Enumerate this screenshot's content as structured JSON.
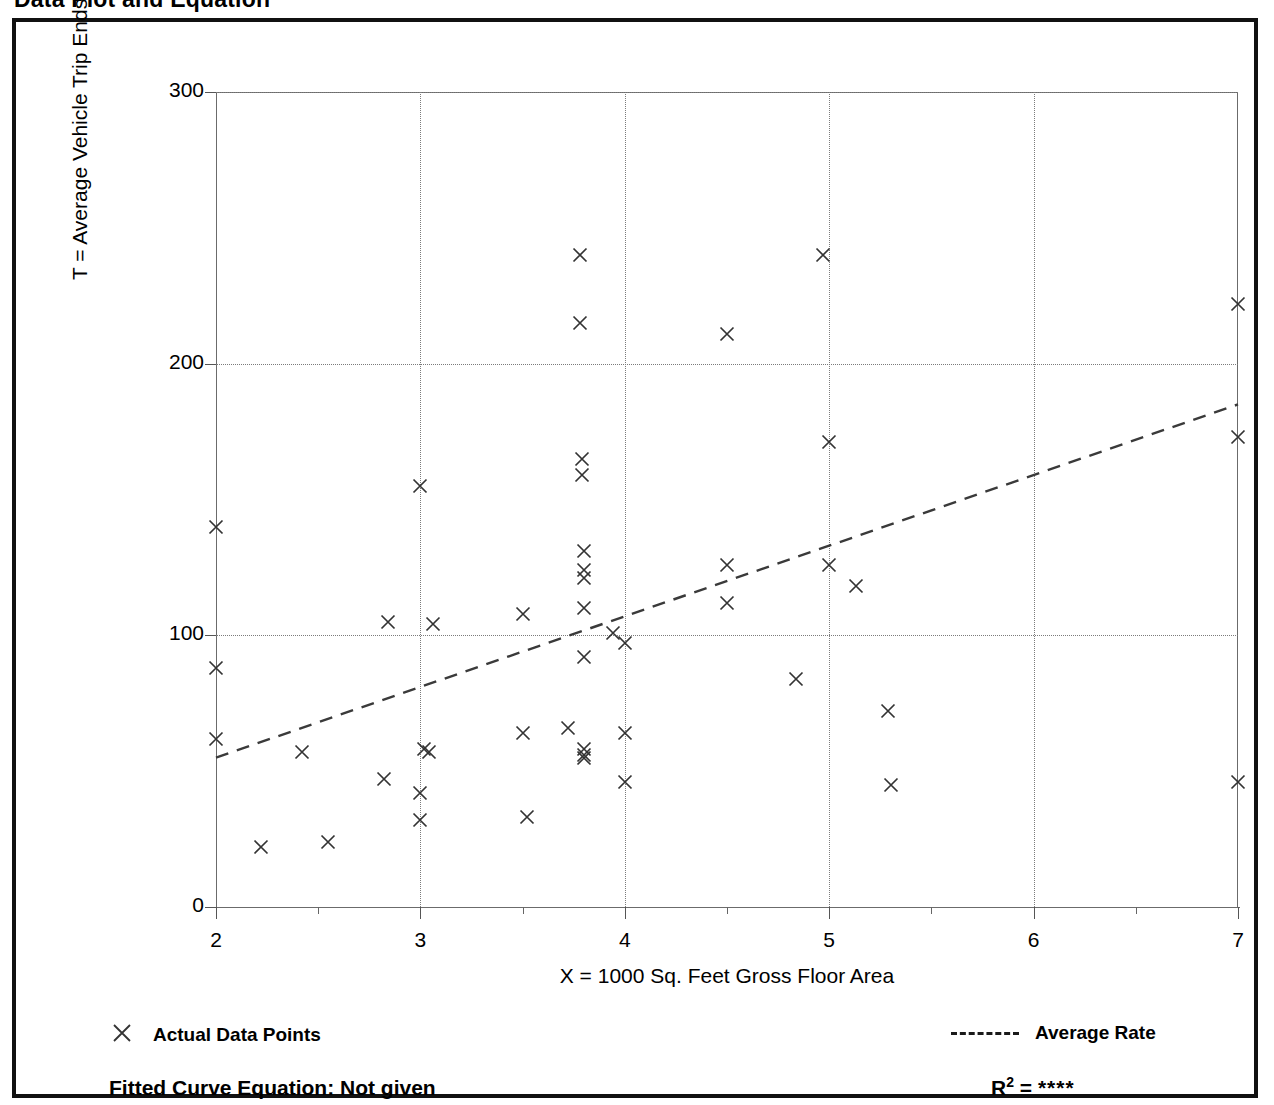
{
  "title": "Data Plot and Equation",
  "axes": {
    "y_title": "T = Average Vehicle Trip Ends",
    "x_title": "X = 1000 Sq. Feet Gross Floor Area",
    "y_ticks": [
      "0",
      "100",
      "200",
      "300"
    ],
    "x_ticks": [
      "2",
      "3",
      "4",
      "5",
      "6",
      "7"
    ]
  },
  "legend": {
    "points_label": "Actual Data Points",
    "points_marker": "x-marker-icon",
    "line_label": "Average Rate",
    "line_marker": "dashed-line-icon"
  },
  "footer": {
    "equation_label": "Fitted Curve Equation:  Not given",
    "r2_label": "R",
    "r2_exponent": "2",
    "r2_equals": " = ",
    "r2_value": "****"
  },
  "colors": {
    "frame": "#111111",
    "axis": "#6b6b6b",
    "grid": "#7b7b7b",
    "marker": "#333333",
    "trend": "#3a3a3a"
  },
  "chart_data": {
    "type": "scatter",
    "title": "Data Plot and Equation",
    "xlabel": "X = 1000 Sq. Feet Gross Floor Area",
    "ylabel": "T = Average Vehicle Trip Ends",
    "xlim": [
      2,
      7
    ],
    "ylim": [
      0,
      300
    ],
    "grid": true,
    "y_gridlines": [
      100,
      200,
      300
    ],
    "x_gridlines": [
      3,
      4,
      5,
      6
    ],
    "x_minor_ticks": [
      2.5,
      3.5,
      4.5,
      5.5,
      6.5
    ],
    "legend_position": "below-axes",
    "series": [
      {
        "name": "Actual Data Points",
        "type": "scatter",
        "marker": "x",
        "points": [
          [
            2.0,
            140
          ],
          [
            2.0,
            88
          ],
          [
            2.0,
            62
          ],
          [
            2.22,
            22
          ],
          [
            2.42,
            57
          ],
          [
            2.55,
            24
          ],
          [
            2.82,
            47
          ],
          [
            2.84,
            105
          ],
          [
            3.0,
            155
          ],
          [
            3.0,
            42
          ],
          [
            3.0,
            32
          ],
          [
            3.02,
            58
          ],
          [
            3.04,
            57
          ],
          [
            3.06,
            104
          ],
          [
            3.5,
            108
          ],
          [
            3.5,
            64
          ],
          [
            3.52,
            33
          ],
          [
            3.72,
            66
          ],
          [
            3.78,
            240
          ],
          [
            3.78,
            215
          ],
          [
            3.79,
            165
          ],
          [
            3.79,
            159
          ],
          [
            3.8,
            131
          ],
          [
            3.8,
            124
          ],
          [
            3.8,
            121
          ],
          [
            3.8,
            110
          ],
          [
            3.8,
            92
          ],
          [
            3.8,
            58
          ],
          [
            3.8,
            56
          ],
          [
            3.8,
            55
          ],
          [
            3.94,
            101
          ],
          [
            4.0,
            97
          ],
          [
            4.0,
            64
          ],
          [
            4.0,
            46
          ],
          [
            4.5,
            211
          ],
          [
            4.5,
            126
          ],
          [
            4.5,
            112
          ],
          [
            4.84,
            84
          ],
          [
            4.97,
            240
          ],
          [
            5.0,
            171
          ],
          [
            5.0,
            126
          ],
          [
            5.13,
            118
          ],
          [
            5.29,
            72
          ],
          [
            5.3,
            45
          ],
          [
            7.0,
            222
          ],
          [
            7.0,
            173
          ],
          [
            7.0,
            46
          ]
        ]
      },
      {
        "name": "Average Rate",
        "type": "line",
        "style": "dashed",
        "x": [
          2,
          7
        ],
        "y": [
          55,
          185
        ]
      }
    ]
  }
}
